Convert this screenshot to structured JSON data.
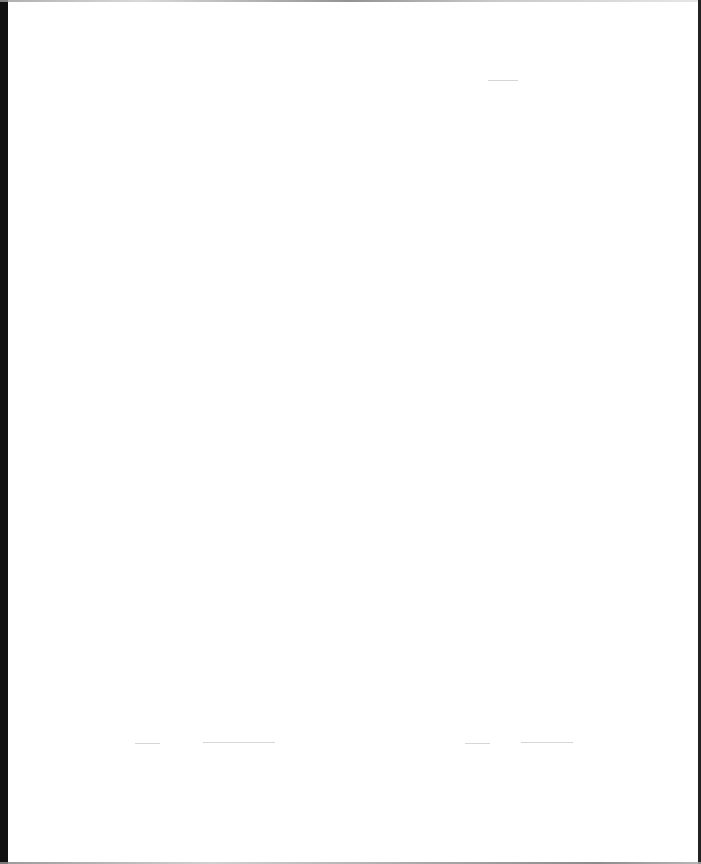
{
  "page": {
    "type": "blank scanned page",
    "text": "",
    "colors": {
      "paper": "#ffffff",
      "left_edge": "#111111",
      "right_edge": "#222222"
    }
  },
  "marks": [
    {
      "x": 135,
      "y": 743,
      "width": 25
    },
    {
      "x": 203,
      "y": 742,
      "width": 72
    },
    {
      "x": 465,
      "y": 743,
      "width": 25
    },
    {
      "x": 521,
      "y": 742,
      "width": 52
    },
    {
      "x": 488,
      "y": 80,
      "width": 30
    }
  ]
}
